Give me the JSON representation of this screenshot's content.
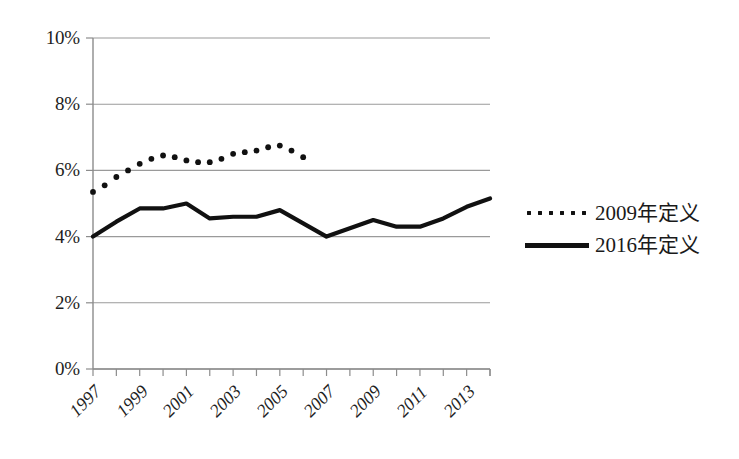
{
  "chart_data": {
    "type": "line",
    "title": "",
    "subtitle": "",
    "xlabel": "",
    "ylabel": "",
    "grid": true,
    "legend_position": "right",
    "ylim": [
      0,
      10
    ],
    "y_unit": "%",
    "y_ticks": [
      "0%",
      "2%",
      "4%",
      "6%",
      "8%",
      "10%"
    ],
    "y_tick_values": [
      0,
      2,
      4,
      6,
      8,
      10
    ],
    "x": [
      1997,
      1998,
      1999,
      2000,
      2001,
      2002,
      2003,
      2004,
      2005,
      2006,
      2007,
      2008,
      2009,
      2010,
      2011,
      2012,
      2013,
      2014
    ],
    "x_tick_labels": [
      "1997",
      "",
      "1999",
      "",
      "2001",
      "",
      "2003",
      "",
      "2005",
      "",
      "2007",
      "",
      "2009",
      "",
      "2011",
      "",
      "2013",
      ""
    ],
    "x_labels_shown": [
      "1997",
      "1999",
      "2001",
      "2003",
      "2005",
      "2007",
      "2009",
      "2011",
      "2013"
    ],
    "xlim": [
      1997,
      2014
    ],
    "series": [
      {
        "name": "2009年定义",
        "style": "dotted",
        "color": "#111111",
        "x": [
          1997,
          1998,
          1999,
          2000,
          2001,
          2002,
          2003,
          2004,
          2005,
          2006
        ],
        "values": [
          5.35,
          5.8,
          6.2,
          6.45,
          6.3,
          6.25,
          6.5,
          6.6,
          6.75,
          6.4
        ],
        "points_per_year": 2,
        "values_dense": [
          5.35,
          5.55,
          5.8,
          6.0,
          6.2,
          6.35,
          6.45,
          6.4,
          6.3,
          6.25,
          6.25,
          6.35,
          6.5,
          6.55,
          6.6,
          6.7,
          6.75,
          6.6,
          6.4
        ]
      },
      {
        "name": "2016年定义",
        "style": "solid",
        "color": "#111111",
        "x": [
          1997,
          1998,
          1999,
          2000,
          2001,
          2002,
          2003,
          2004,
          2005,
          2006,
          2007,
          2008,
          2009,
          2010,
          2011,
          2012,
          2013,
          2014
        ],
        "values": [
          4.0,
          4.45,
          4.85,
          4.85,
          5.0,
          4.55,
          4.6,
          4.6,
          4.8,
          4.4,
          4.0,
          4.25,
          4.5,
          4.3,
          4.3,
          4.55,
          4.9,
          5.15
        ]
      }
    ]
  },
  "legend": {
    "items": [
      {
        "label": "2009年定义",
        "marker": "dotted-line-marker"
      },
      {
        "label": "2016年定义",
        "marker": "solid-line-marker"
      }
    ]
  },
  "axes": {
    "y_labels": [
      "10%",
      "8%",
      "6%",
      "4%",
      "2%",
      "0%"
    ],
    "x_labels": [
      "1997",
      "1999",
      "2001",
      "2003",
      "2005",
      "2007",
      "2009",
      "2011",
      "2013"
    ]
  },
  "colors": {
    "series_ink": "#111111",
    "gridline": "#9a9a9a",
    "axis": "#8c8c8c",
    "text": "#1a1a1a",
    "background": "#ffffff"
  }
}
